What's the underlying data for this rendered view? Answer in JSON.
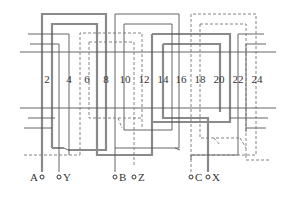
{
  "diagram": {
    "type": "three-phase-winding-diagram",
    "slot_labels": [
      "2",
      "4",
      "6",
      "8",
      "10",
      "12",
      "14",
      "16",
      "18",
      "20",
      "22",
      "24"
    ],
    "terminals": [
      {
        "label": "A",
        "side": "left"
      },
      {
        "label": "Y",
        "side": "right"
      },
      {
        "label": "B",
        "side": "right"
      },
      {
        "label": "Z",
        "side": "right"
      },
      {
        "label": "C",
        "side": "right"
      },
      {
        "label": "X",
        "side": "right"
      }
    ],
    "line_styles": {
      "thick": "#8a8a8a",
      "thin": "#555555",
      "dashed": "#777777"
    }
  }
}
